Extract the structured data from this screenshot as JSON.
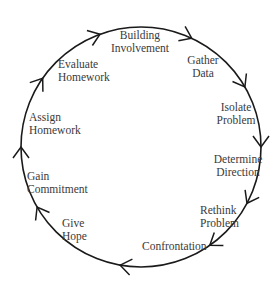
{
  "diagram": {
    "type": "cycle",
    "direction": "clockwise",
    "circle": {
      "cx": 141,
      "cy": 147,
      "r": 120,
      "stroke": "#1a1a1a"
    },
    "arrow_angles_deg": [
      110,
      65,
      30,
      0,
      -28,
      -55,
      -100,
      -150,
      180,
      145
    ],
    "stages": [
      {
        "id": "building-involvement",
        "lines": [
          "Building",
          "Involvement"
        ],
        "x": 140,
        "y": 39,
        "anchor": "middle"
      },
      {
        "id": "gather-data",
        "lines": [
          "Gather",
          "Data"
        ],
        "x": 203,
        "y": 64,
        "anchor": "middle"
      },
      {
        "id": "isolate-problem",
        "lines": [
          "Isolate",
          "Problem"
        ],
        "x": 236,
        "y": 111,
        "anchor": "middle"
      },
      {
        "id": "determine-direction",
        "lines": [
          "Determine",
          "Direction"
        ],
        "x": 238,
        "y": 163,
        "anchor": "middle"
      },
      {
        "id": "rethink-problem",
        "lines": [
          "Rethink",
          "Problem"
        ],
        "x": 200,
        "y": 214,
        "anchor": "start"
      },
      {
        "id": "confrontation",
        "lines": [
          "Confrontation"
        ],
        "x": 142,
        "y": 250,
        "anchor": "start"
      },
      {
        "id": "give-hope",
        "lines": [
          "Give",
          "Hope"
        ],
        "x": 62,
        "y": 227,
        "anchor": "start"
      },
      {
        "id": "gain-commitment",
        "lines": [
          "Gain",
          "Commitment"
        ],
        "x": 27,
        "y": 180,
        "anchor": "start"
      },
      {
        "id": "assign-homework",
        "lines": [
          "Assign",
          "Homework"
        ],
        "x": 29,
        "y": 121,
        "anchor": "start"
      },
      {
        "id": "evaluate-homework",
        "lines": [
          "Evaluate",
          "Homework"
        ],
        "x": 58,
        "y": 68,
        "anchor": "start"
      }
    ]
  }
}
